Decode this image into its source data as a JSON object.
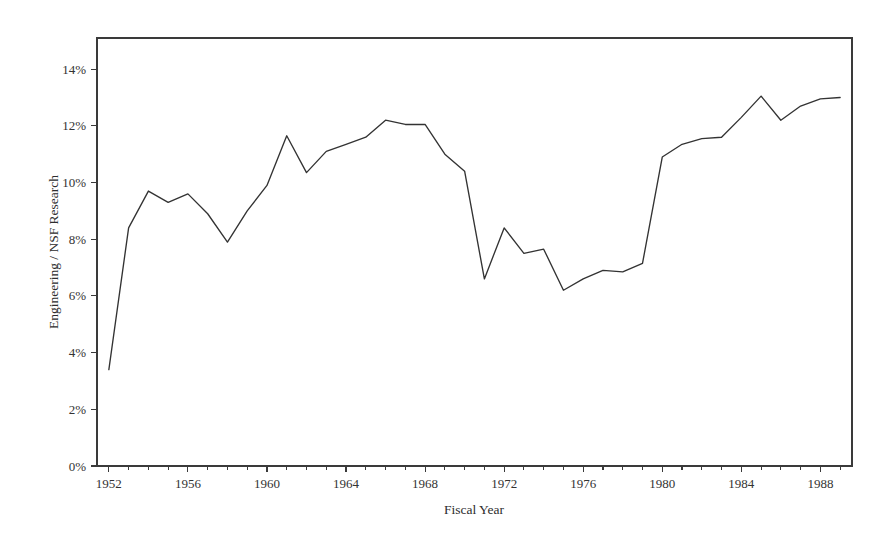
{
  "chart_data": {
    "type": "line",
    "title": "",
    "xlabel": "Fiscal Year",
    "ylabel": "Engineering / NSF Research",
    "xlim": [
      1951.4,
      1989.6
    ],
    "ylim": [
      0,
      15.1
    ],
    "grid": false,
    "legend": false,
    "legend_position": "none",
    "y_tick_labels": [
      "0%",
      "2%",
      "4%",
      "6%",
      "8%",
      "10%",
      "12%",
      "14%"
    ],
    "y_tick_values": [
      0,
      2,
      4,
      6,
      8,
      10,
      12,
      14
    ],
    "x_tick_labels": [
      "1952",
      "1956",
      "1960",
      "1964",
      "1968",
      "1972",
      "1976",
      "1980",
      "1984",
      "1988"
    ],
    "x_tick_values": [
      1952,
      1956,
      1960,
      1964,
      1968,
      1972,
      1976,
      1980,
      1984,
      1988
    ],
    "x_minor_tick_values": [
      1953,
      1954,
      1955,
      1957,
      1958,
      1959,
      1961,
      1962,
      1963,
      1965,
      1966,
      1967,
      1969,
      1970,
      1971,
      1973,
      1974,
      1975,
      1977,
      1978,
      1979,
      1981,
      1982,
      1983,
      1985,
      1986,
      1987,
      1989
    ],
    "series": [
      {
        "name": "Engineering share of NSF Research",
        "color": "#333333",
        "x": [
          1952,
          1953,
          1954,
          1955,
          1956,
          1957,
          1958,
          1959,
          1960,
          1961,
          1962,
          1963,
          1964,
          1965,
          1966,
          1967,
          1968,
          1969,
          1970,
          1971,
          1972,
          1973,
          1974,
          1975,
          1976,
          1977,
          1978,
          1979,
          1980,
          1981,
          1982,
          1983,
          1984,
          1985,
          1986,
          1987,
          1988,
          1989
        ],
        "values": [
          3.4,
          8.4,
          9.7,
          9.3,
          9.6,
          8.9,
          7.9,
          9.0,
          9.9,
          11.65,
          10.35,
          11.1,
          11.35,
          11.6,
          12.2,
          12.05,
          12.05,
          11.0,
          10.4,
          6.6,
          8.4,
          7.5,
          7.65,
          6.2,
          6.6,
          6.9,
          6.85,
          7.15,
          10.9,
          11.35,
          11.55,
          11.6,
          12.3,
          13.05,
          12.2,
          12.7,
          12.95,
          13.0
        ]
      }
    ]
  },
  "axes": {
    "x_axis_name": "fiscal-year-axis",
    "y_axis_name": "percentage-axis"
  }
}
